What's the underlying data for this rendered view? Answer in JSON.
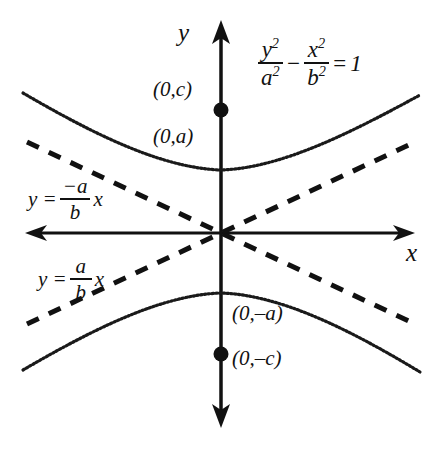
{
  "figure": {
    "type": "hyperbola-diagram",
    "background_color": "#ffffff",
    "stroke_color": "#111111"
  },
  "axes": {
    "x_label": "x",
    "y_label": "y",
    "origin_px": [
      221,
      233
    ],
    "x_range_px": [
      25,
      415
    ],
    "y_range_px": [
      20,
      428
    ]
  },
  "equation": {
    "lhs_num_1": "y",
    "lhs_num_1_exp": "2",
    "lhs_den_1": "a",
    "lhs_den_1_exp": "2",
    "operator": "−",
    "lhs_num_2": "x",
    "lhs_num_2_exp": "2",
    "lhs_den_2": "b",
    "lhs_den_2_exp": "2",
    "equals": "=",
    "rhs": "1",
    "plain": "y²/a² − x²/b² = 1"
  },
  "asymptotes": [
    {
      "name": "negative-slope-asymptote",
      "lead": "y =",
      "numerator": "−a",
      "denominator": "b",
      "variable": "x",
      "plain": "y = (−a/b)x",
      "slope": -0.47,
      "style": "dashed"
    },
    {
      "name": "positive-slope-asymptote",
      "lead": "y =",
      "numerator": "a",
      "denominator": "b",
      "variable": "x",
      "plain": "y = (a/b)x",
      "slope": 0.47,
      "style": "dashed"
    }
  ],
  "points": [
    {
      "id": "focus-upper",
      "label": "(0,c)",
      "marker": "filled-dot",
      "px": [
        221,
        110
      ]
    },
    {
      "id": "vertex-upper",
      "label": "(0,a)",
      "marker": "none",
      "px": [
        221,
        170
      ]
    },
    {
      "id": "vertex-lower",
      "label": "(0,–a)",
      "marker": "none",
      "px": [
        221,
        293
      ]
    },
    {
      "id": "focus-lower",
      "label": "(0,–c)",
      "marker": "filled-dot",
      "px": [
        221,
        354
      ]
    }
  ],
  "curves": [
    {
      "name": "upper-branch",
      "style": "dotted",
      "vertex_px": [
        221,
        170
      ],
      "left_end_px": [
        23,
        93
      ],
      "right_end_px": [
        420,
        95
      ]
    },
    {
      "name": "lower-branch",
      "style": "dotted",
      "vertex_px": [
        221,
        293
      ],
      "left_end_px": [
        23,
        370
      ],
      "right_end_px": [
        420,
        372
      ]
    }
  ]
}
